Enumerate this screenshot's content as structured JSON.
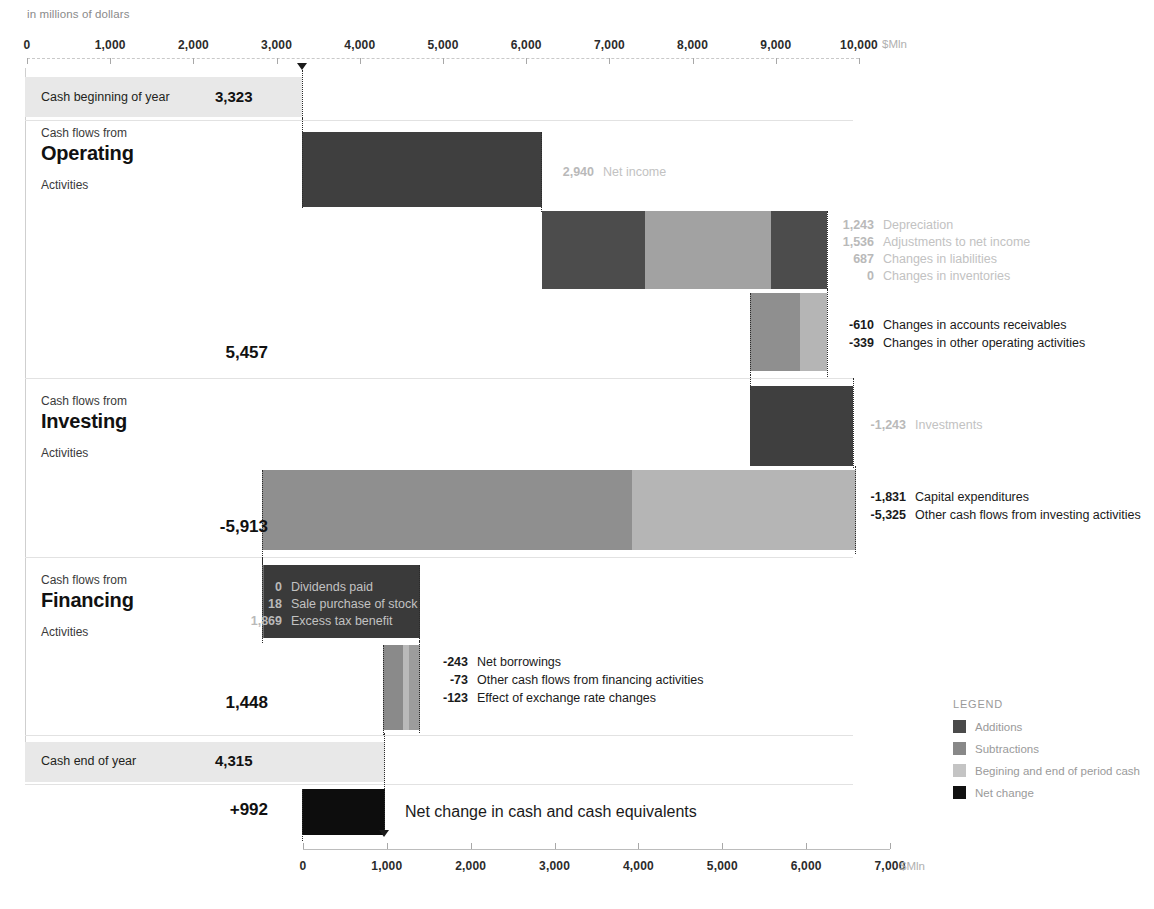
{
  "subtitle": "in millions of dollars",
  "axes": {
    "top": {
      "ticks": [
        0,
        1000,
        2000,
        3000,
        4000,
        5000,
        6000,
        7000,
        8000,
        9000,
        10000
      ],
      "tick_labels": [
        "0",
        "1,000",
        "2,000",
        "3,000",
        "4,000",
        "5,000",
        "6,000",
        "7,000",
        "8,000",
        "9,000",
        "10,000"
      ],
      "unit": "$Mln",
      "min": 0,
      "max": 10000
    },
    "bottom": {
      "ticks": [
        0,
        1000,
        2000,
        3000,
        4000,
        5000,
        6000,
        7000
      ],
      "tick_labels": [
        "0",
        "1,000",
        "2,000",
        "3,000",
        "4,000",
        "5,000",
        "6,000",
        "7,000"
      ],
      "unit": "$Mln",
      "min": 0,
      "max": 7000
    }
  },
  "bands": {
    "begin": {
      "label": "Cash beginning of year",
      "value": "3,323"
    },
    "end": {
      "label": "Cash  end of year",
      "value": "4,315"
    }
  },
  "sections": {
    "operating": {
      "pre": "Cash flows from",
      "main": "Operating",
      "post": "Activities",
      "subtotal": "5,457"
    },
    "investing": {
      "pre": "Cash flows from",
      "main": "Investing",
      "post": "Activities",
      "subtotal": "-5,913"
    },
    "financing": {
      "pre": "Cash flows from",
      "main": "Financing",
      "post": "Activities",
      "subtotal": "1,448"
    }
  },
  "net_change": {
    "value": "+992",
    "label": "Net change in cash and cash equivalents"
  },
  "callouts": {
    "net_income": [
      {
        "num": "2,940",
        "txt": "Net income"
      }
    ],
    "adjustments": [
      {
        "num": "1,243",
        "txt": "Depreciation"
      },
      {
        "num": "1,536",
        "txt": "Adjustments to net income"
      },
      {
        "num": "687",
        "txt": "Changes in liabilities"
      },
      {
        "num": "0",
        "txt": "Changes in inventories"
      }
    ],
    "op_subtractions": [
      {
        "num": "-610",
        "txt": "Changes in accounts receivables"
      },
      {
        "num": "-339",
        "txt": "Changes in other operating activities"
      }
    ],
    "investments": [
      {
        "num": "-1,243",
        "txt": "Investments"
      }
    ],
    "inv_subtractions": [
      {
        "num": "-1,831",
        "txt": "Capital expenditures"
      },
      {
        "num": "-5,325",
        "txt": "Other cash flows from investing activities"
      }
    ],
    "fin_additions": [
      {
        "num": "0",
        "txt": "Dividends paid"
      },
      {
        "num": "18",
        "txt": "Sale purchase of stock"
      },
      {
        "num": "1,869",
        "txt": "Excess tax benefit"
      }
    ],
    "fin_subtractions": [
      {
        "num": "-243",
        "txt": "Net borrowings"
      },
      {
        "num": "-73",
        "txt": "Other cash flows from financing activities"
      },
      {
        "num": "-123",
        "txt": "Effect of exchange rate changes"
      }
    ]
  },
  "legend": {
    "title": "LEGEND",
    "items": [
      {
        "label": "Additions",
        "color": "#4a4a4a"
      },
      {
        "label": "Subtractions",
        "color": "#888888"
      },
      {
        "label": "Begining and end of period cash",
        "color": "#c4c4c4"
      },
      {
        "label": "Net change",
        "color": "#111111"
      }
    ]
  },
  "colors": {
    "addition_dark": "#4a4a4a",
    "addition_light": "#9a9a9a",
    "subtraction_dark": "#8f8f8f",
    "subtraction_light": "#b5b5b5",
    "period_cash": "#e8e8e8",
    "net_change": "#111111"
  },
  "chart_data": {
    "type": "bar",
    "subtype": "waterfall",
    "title": "",
    "subtitle": "in millions of dollars",
    "xlabel": "$Mln",
    "ylabel": "",
    "xlim_top": [
      0,
      10000
    ],
    "xlim_bottom": [
      0,
      7000
    ],
    "grid": true,
    "legend_position": "bottom-right",
    "start_value": 3323,
    "end_value": 4315,
    "net_change": 992,
    "subtotals": {
      "operating": 5457,
      "investing": -5913,
      "financing": 1448
    },
    "categories": [
      "Cash beginning of year",
      "Net income",
      "Depreciation",
      "Adjustments to net income",
      "Changes in liabilities",
      "Changes in inventories",
      "Changes in accounts receivables",
      "Changes in other operating activities",
      "Investments",
      "Capital expenditures",
      "Other cash flows from investing activities",
      "Dividends paid",
      "Sale purchase of stock",
      "Excess tax benefit",
      "Net borrowings",
      "Other cash flows from financing activities",
      "Effect of exchange rate changes",
      "Cash end of year",
      "Net change in cash and cash equivalents"
    ],
    "values": [
      3323,
      2940,
      1243,
      1536,
      687,
      0,
      -610,
      -339,
      -1243,
      -1831,
      -5325,
      0,
      18,
      1869,
      -243,
      -73,
      -123,
      4315,
      992
    ],
    "kinds": [
      "total",
      "addition",
      "addition",
      "addition",
      "addition",
      "addition",
      "subtraction",
      "subtraction",
      "subtraction",
      "subtraction",
      "subtraction",
      "addition",
      "addition",
      "addition",
      "subtraction",
      "subtraction",
      "subtraction",
      "total",
      "net"
    ]
  },
  "geometry": {
    "top_axis": {
      "x0": 27,
      "x_max": 859,
      "y": 58
    },
    "bottom_axis": {
      "x0": 303,
      "x_max": 890,
      "y": 849
    }
  }
}
